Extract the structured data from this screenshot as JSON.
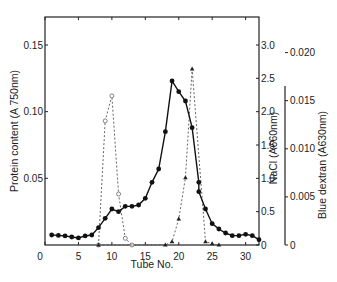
{
  "chart_data": {
    "type": "line",
    "title": "",
    "xlabel": "Tube No.",
    "ylabel_left": "Protein content (A 750nm)",
    "ylabel_right_1": "NaCl (A660nm)",
    "ylabel_right_2": "Blue dextran (A630nm)",
    "x_ticks": [
      "0",
      "5",
      "10",
      "15",
      "20",
      "25",
      "30"
    ],
    "xlim": [
      0,
      32
    ],
    "left_ticks": [
      "0.05",
      "0.10",
      "0.15"
    ],
    "left_ylim": [
      0,
      0.171
    ],
    "right1_ticks": [
      "0",
      "0.5",
      "1.0",
      "1.5",
      "2.0",
      "2.5",
      "3.0"
    ],
    "right1_ylim": [
      0,
      3.42
    ],
    "right2_ticks": [
      "0",
      "0.005",
      "0.010",
      "0.015",
      "0.020"
    ],
    "right2_ylim": [
      0,
      0.0237
    ],
    "grid": false,
    "series": [
      {
        "name": "Protein content",
        "axis": "left",
        "style": "solid line, filled circles",
        "x": [
          1,
          2,
          3,
          4,
          5,
          6,
          7,
          8,
          9,
          10,
          11,
          12,
          13,
          14,
          15,
          16,
          17,
          18,
          19,
          20,
          21,
          22,
          23,
          23,
          24,
          25,
          26,
          27,
          28,
          29,
          30,
          31,
          32
        ],
        "values": [
          0.0075,
          0.0072,
          0.0068,
          0.006,
          0.0053,
          0.0068,
          0.0075,
          0.013,
          0.02,
          0.027,
          0.025,
          0.029,
          0.029,
          0.03,
          0.035,
          0.047,
          0.057,
          0.085,
          0.123,
          0.115,
          0.108,
          0.088,
          0.047,
          0.04,
          0.027,
          0.016,
          0.012,
          0.009,
          0.007,
          0.007,
          0.008,
          0.007,
          0.004
        ]
      },
      {
        "name": "NaCl",
        "axis": "right1",
        "style": "dashed line, filled triangles",
        "x": [
          8,
          18,
          19,
          20,
          21,
          22,
          24,
          25,
          26
        ],
        "values": [
          0,
          0,
          0.05,
          0.39,
          1.01,
          2.64,
          0.05,
          0.02,
          0
        ]
      },
      {
        "name": "Blue dextran",
        "axis": "right2",
        "style": "dashed line, open circles",
        "x": [
          8,
          9,
          10,
          11,
          12,
          13
        ],
        "values": [
          0,
          0.0129,
          0.0155,
          0.0053,
          0.0007,
          0
        ]
      }
    ]
  }
}
